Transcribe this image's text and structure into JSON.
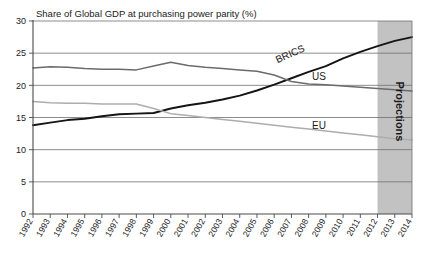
{
  "chart_data": {
    "type": "line",
    "title": "Share of Global GDP at purchasing power parity (%)",
    "xlabel": "",
    "ylabel": "",
    "ylim": [
      0,
      30
    ],
    "ytick_step": 5,
    "yticks": [
      "0",
      "5",
      "10",
      "15",
      "20",
      "25",
      "30"
    ],
    "grid": true,
    "legend_position": "inline-labels",
    "x": [
      1992,
      1993,
      1994,
      1995,
      1996,
      1997,
      1998,
      1999,
      2000,
      2001,
      2002,
      2003,
      2004,
      2005,
      2006,
      2007,
      2008,
      2009,
      2010,
      2011,
      2012,
      2013,
      2014
    ],
    "categories": [
      "1992",
      "1993",
      "1994",
      "1995",
      "1996",
      "1997",
      "1998",
      "1999",
      "2000",
      "2001",
      "2002",
      "2003",
      "2004",
      "2005",
      "2006",
      "2007",
      "2008",
      "2009",
      "2010",
      "2011",
      "2012",
      "2013",
      "2014"
    ],
    "series": [
      {
        "name": "BRICS",
        "color": "#141414",
        "width": 1.9,
        "label_x": 2007.0,
        "label_y": 24.4,
        "label_rotation": -24,
        "values": [
          13.8,
          14.2,
          14.6,
          14.8,
          15.2,
          15.5,
          15.6,
          15.7,
          16.4,
          16.9,
          17.3,
          17.8,
          18.4,
          19.2,
          20.1,
          21.1,
          22.1,
          23.0,
          24.2,
          25.2,
          26.1,
          26.9,
          27.5
        ]
      },
      {
        "name": "US",
        "color": "#6b6b6b",
        "width": 1.5,
        "label_x": 2008.6,
        "label_y": 20.9,
        "label_rotation": 0,
        "values": [
          22.7,
          22.9,
          22.8,
          22.6,
          22.5,
          22.5,
          22.4,
          23.0,
          23.6,
          23.1,
          22.8,
          22.6,
          22.4,
          22.2,
          21.6,
          20.6,
          20.2,
          20.1,
          19.9,
          19.7,
          19.5,
          19.3,
          19.1
        ]
      },
      {
        "name": "EU",
        "color": "#adadad",
        "width": 1.5,
        "label_x": 2008.6,
        "label_y": 13.2,
        "label_rotation": 0,
        "values": [
          17.5,
          17.3,
          17.2,
          17.2,
          17.1,
          17.1,
          17.1,
          16.4,
          15.6,
          15.3,
          15.0,
          14.7,
          14.4,
          14.1,
          13.8,
          13.5,
          13.2,
          12.9,
          12.6,
          12.3,
          12.0,
          11.7,
          11.5
        ]
      }
    ],
    "annotations": [
      {
        "name": "projections-band",
        "label": "Projections",
        "x_start": 2012,
        "x_end": 2014,
        "fill": "#c2c2c2",
        "rotation": 90
      }
    ]
  }
}
